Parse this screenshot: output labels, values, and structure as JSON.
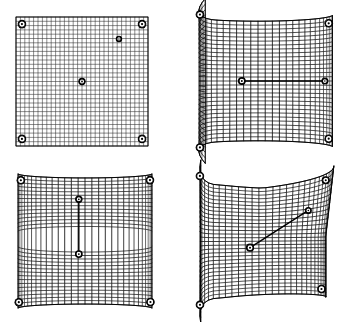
{
  "figure": {
    "name": "deformable-mesh-sequence",
    "background_color": "#ffffff",
    "line_color": "#000000",
    "marker_fill": "#ffffff",
    "marker_stroke": "#000000",
    "width": 347,
    "height": 322,
    "layout": "2x2-grid",
    "panel_count": 4
  },
  "panels": [
    {
      "id": "panel-flat-grid",
      "label": "(a)",
      "title": "Undeformed planar mesh",
      "shape": "flat-plane",
      "curvature": "none",
      "grid": {
        "rows": 30,
        "cols": 30,
        "line_color": "#000000",
        "line_width": 0.55
      },
      "bounds": {
        "x": 14,
        "y": 15,
        "w": 136,
        "h": 133
      },
      "markers": [
        {
          "name": "corner-node-top-left",
          "cx": 0.045,
          "cy": 0.055,
          "r": 3.2,
          "style": "ringed"
        },
        {
          "name": "corner-node-top-right",
          "cx": 0.955,
          "cy": 0.055,
          "r": 3.2,
          "style": "ringed"
        },
        {
          "name": "corner-node-bottom-left",
          "cx": 0.045,
          "cy": 0.945,
          "r": 3.2,
          "style": "ringed"
        },
        {
          "name": "corner-node-bottom-right",
          "cx": 0.955,
          "cy": 0.945,
          "r": 3.2,
          "style": "ringed"
        },
        {
          "name": "center-control-point",
          "cx": 0.5,
          "cy": 0.5,
          "r": 2.6,
          "style": "ringed"
        },
        {
          "name": "aux-control-point",
          "cx": 0.78,
          "cy": 0.17,
          "r": 2.1,
          "style": "ringed"
        }
      ],
      "segments": []
    },
    {
      "id": "panel-cylindrical-bend",
      "label": "(b)",
      "title": "Cylindrical bend, horizontal pull",
      "shape": "cylinder-vertical-axis",
      "curvature": "single",
      "grid": {
        "rows": 30,
        "cols": 30,
        "line_color": "#000000",
        "line_width": 0.55
      },
      "bounds": {
        "x": 188,
        "y": 14,
        "w": 140,
        "h": 134
      },
      "markers": [
        {
          "name": "corner-node-top-left",
          "cx": 0.065,
          "cy": 0.055,
          "r": 3.2,
          "style": "ringed"
        },
        {
          "name": "corner-node-top-right",
          "cx": 0.925,
          "cy": 0.05,
          "r": 3.2,
          "style": "ringed"
        },
        {
          "name": "corner-node-bottom-left",
          "cx": 0.065,
          "cy": 0.945,
          "r": 3.2,
          "style": "ringed"
        },
        {
          "name": "corner-node-bottom-right",
          "cx": 0.925,
          "cy": 0.95,
          "r": 3.2,
          "style": "ringed"
        },
        {
          "name": "handle-node-start",
          "cx": 0.425,
          "cy": 0.5,
          "r": 2.8,
          "style": "ringed"
        },
        {
          "name": "handle-node-end",
          "cx": 0.88,
          "cy": 0.5,
          "r": 2.4,
          "style": "ringed"
        }
      ],
      "segments": [
        {
          "name": "displacement-vector-horizontal",
          "x1": 0.425,
          "y1": 0.5,
          "x2": 0.88,
          "y2": 0.5,
          "width": 1.4
        }
      ]
    },
    {
      "id": "panel-vertical-ridge-fold",
      "label": "(c)",
      "title": "Vertical ridge fold, downward pull",
      "shape": "ridge-vertical",
      "curvature": "single-inverted",
      "grid": {
        "rows": 30,
        "cols": 30,
        "line_color": "#000000",
        "line_width": 0.55
      },
      "bounds": {
        "x": 16,
        "y": 174,
        "w": 138,
        "h": 134
      },
      "markers": [
        {
          "name": "corner-node-top-left",
          "cx": 0.085,
          "cy": 0.045,
          "r": 3.2,
          "style": "ringed"
        },
        {
          "name": "corner-node-top-right",
          "cx": 0.93,
          "cy": 0.045,
          "r": 3.2,
          "style": "ringed"
        },
        {
          "name": "corner-node-bottom-left",
          "cx": 0.04,
          "cy": 0.955,
          "r": 3.2,
          "style": "ringed"
        },
        {
          "name": "corner-node-bottom-right",
          "cx": 0.94,
          "cy": 0.955,
          "r": 3.2,
          "style": "ringed"
        },
        {
          "name": "handle-node-start",
          "cx": 0.47,
          "cy": 0.205,
          "r": 2.6,
          "style": "ringed"
        },
        {
          "name": "handle-node-end",
          "cx": 0.47,
          "cy": 0.52,
          "r": 2.8,
          "style": "ringed"
        }
      ],
      "segments": [
        {
          "name": "displacement-vector-vertical",
          "x1": 0.47,
          "y1": 0.205,
          "x2": 0.47,
          "y2": 0.52,
          "width": 1.4
        }
      ]
    },
    {
      "id": "panel-saddle-corner-fold",
      "label": "(d)",
      "title": "Doubly curved saddle corner",
      "shape": "saddle-corner",
      "curvature": "double",
      "grid": {
        "rows": 30,
        "cols": 30,
        "line_color": "#000000",
        "line_width": 0.55
      },
      "bounds": {
        "x": 182,
        "y": 170,
        "w": 152,
        "h": 143
      },
      "markers": [
        {
          "name": "corner-node-top-left",
          "cx": 0.04,
          "cy": 0.055,
          "r": 3.2,
          "style": "ringed"
        },
        {
          "name": "corner-node-top-right",
          "cx": 0.83,
          "cy": 0.045,
          "r": 3.0,
          "style": "ringed"
        },
        {
          "name": "corner-node-bottom-left",
          "cx": 0.05,
          "cy": 0.94,
          "r": 3.2,
          "style": "ringed"
        },
        {
          "name": "corner-node-bottom-right",
          "cx": 0.84,
          "cy": 0.945,
          "r": 3.2,
          "style": "ringed"
        },
        {
          "name": "handle-node-start",
          "cx": 0.39,
          "cy": 0.56,
          "r": 3.0,
          "style": "ringed"
        },
        {
          "name": "handle-node-end",
          "cx": 0.7,
          "cy": 0.245,
          "r": 2.4,
          "style": "ringed"
        }
      ],
      "segments": [
        {
          "name": "displacement-vector-diagonal",
          "x1": 0.39,
          "y1": 0.56,
          "x2": 0.7,
          "y2": 0.245,
          "width": 1.5
        }
      ]
    }
  ]
}
